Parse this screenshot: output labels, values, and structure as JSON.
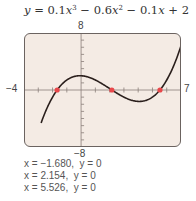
{
  "equation": {
    "text": "y = 0.1x^3 − 0.6x^2 − 0.1x + 2",
    "y": "y",
    "eq": " = 0.1",
    "x1": "x",
    "exp3": "3",
    "mid": " − 0.6",
    "x2": "x",
    "exp2": "2",
    "mid2": " − 0.1",
    "x3": "x",
    "tail": " + 2"
  },
  "window": {
    "xmin": "−4",
    "xmax": "7",
    "ymin": "−8",
    "ymax": "8"
  },
  "results": [
    "x = −1.680,  y = 0",
    "x = 2.154,  y = 0",
    "x = 5.526,  y = 0"
  ],
  "colors": {
    "screen_bg": "#f4ebe4",
    "curve": "#2a1f1c",
    "zero_marker": "#e8474a",
    "axis": "#8a7f7a"
  },
  "chart_data": {
    "type": "line",
    "xlabel": "",
    "ylabel": "",
    "xlim": [
      -4,
      7
    ],
    "ylim": [
      -8,
      8
    ],
    "grid": false,
    "x_tick_step": 1,
    "y_tick_step": 1,
    "series": [
      {
        "name": "y = 0.1x^3 - 0.6x^2 - 0.1x + 2",
        "x": [
          -2.8,
          -2.5,
          -2,
          -1.5,
          -1,
          -0.5,
          0,
          0.5,
          1,
          1.5,
          2,
          2.5,
          3,
          3.5,
          4,
          4.5,
          5,
          5.5,
          6,
          6.5,
          7
        ],
        "y": [
          -7.17,
          -5.06,
          -1.8,
          0.46,
          1.5,
          1.54,
          2.0,
          1.81,
          1.3,
          0.6,
          -0.2,
          -1.04,
          -1.6,
          -2.03,
          -2.0,
          -1.67,
          -1.0,
          -0.04,
          1.4,
          3.16,
          5.6
        ]
      }
    ],
    "zeros": [
      {
        "x": -1.68,
        "y": 0
      },
      {
        "x": 2.154,
        "y": 0
      },
      {
        "x": 5.526,
        "y": 0
      }
    ],
    "annotations": [
      "x = −1.680, y = 0",
      "x = 2.154, y = 0",
      "x = 5.526, y = 0"
    ]
  }
}
